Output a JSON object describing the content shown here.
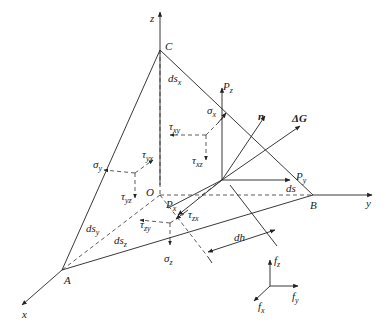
{
  "figure": {
    "axes": {
      "x": "x",
      "y": "y",
      "z": "z"
    },
    "points": {
      "origin": "O",
      "A": "A",
      "B": "B",
      "C": "C"
    },
    "areas": {
      "ds_x": "ds",
      "ds_x_sub": "x",
      "ds_y": "ds",
      "ds_y_sub": "y",
      "ds_z": "ds",
      "ds_z_sub": "z",
      "ds": "ds"
    },
    "height": "dh",
    "stresses": {
      "sigma_x": "σ",
      "sigma_x_sub": "x",
      "sigma_y": "σ",
      "sigma_y_sub": "y",
      "sigma_z": "σ",
      "sigma_z_sub": "z",
      "tau_xy": "τ",
      "tau_xy_sub": "xy",
      "tau_xz": "τ",
      "tau_xz_sub": "xz",
      "tau_yx": "τ",
      "tau_yx_sub": "yx",
      "tau_yz": "τ",
      "tau_yz_sub": "yz",
      "tau_zx": "τ",
      "tau_zx_sub": "zx",
      "tau_zy": "τ",
      "tau_zy_sub": "zy"
    },
    "surface_forces": {
      "Px": "P",
      "Px_sub": "x",
      "Py": "P",
      "Py_sub": "y",
      "Pz": "P",
      "Pz_sub": "z"
    },
    "normal": "n",
    "weight": "ΔG",
    "body_forces": {
      "fx": "f",
      "fx_sub": "x",
      "fy": "f",
      "fy_sub": "y",
      "fz": "f",
      "fz_sub": "z"
    }
  }
}
